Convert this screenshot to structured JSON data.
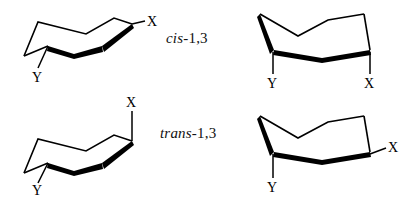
{
  "figure": {
    "kind": "chemical-structure-diagram",
    "background_color": "#ffffff",
    "line_color": "#000000"
  },
  "row_labels": {
    "cis": {
      "stereo": "cis",
      "positions": "-1,3"
    },
    "trans": {
      "stereo": "trans",
      "positions": "-1,3"
    }
  },
  "structures": [
    {
      "id": "cis-left",
      "row": "cis",
      "column": "left",
      "description": "Chair conformer with X equatorial and Y axial",
      "substituents": [
        {
          "label": "X",
          "orientation": "equatorial",
          "direction": "up-right"
        },
        {
          "label": "Y",
          "orientation": "axial",
          "direction": "down-left"
        }
      ]
    },
    {
      "id": "cis-right",
      "row": "cis",
      "column": "right",
      "description": "Ring-flipped chair conformer with both X and Y axial pointing down",
      "substituents": [
        {
          "label": "Y",
          "orientation": "axial",
          "direction": "down"
        },
        {
          "label": "X",
          "orientation": "axial",
          "direction": "down"
        }
      ]
    },
    {
      "id": "trans-left",
      "row": "trans",
      "column": "left",
      "description": "Chair conformer with X axial up and Y axial down",
      "substituents": [
        {
          "label": "X",
          "orientation": "axial",
          "direction": "up"
        },
        {
          "label": "Y",
          "orientation": "axial",
          "direction": "down-left"
        }
      ]
    },
    {
      "id": "trans-right",
      "row": "trans",
      "column": "right",
      "description": "Ring-flipped chair conformer with Y axial down and X equatorial",
      "substituents": [
        {
          "label": "Y",
          "orientation": "axial",
          "direction": "down"
        },
        {
          "label": "X",
          "orientation": "equatorial",
          "direction": "right"
        }
      ]
    }
  ],
  "atom_labels": {
    "x": "X",
    "y": "Y"
  }
}
